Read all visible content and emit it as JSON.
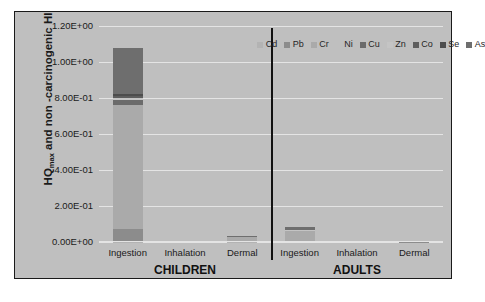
{
  "chart_data": {
    "type": "bar",
    "subtype": "stacked-bar",
    "title": "",
    "xlabel": "",
    "ylabel": "HQmax and non -carcinogenic HI",
    "ylabel_parts": {
      "prefix": "HQ",
      "sub": "max",
      "suffix": " and non -carcinogenic HI"
    },
    "ylim": [
      0,
      1.2
    ],
    "yticks": [
      0,
      0.2,
      0.4,
      0.6,
      0.8,
      1.0,
      1.2
    ],
    "ytick_labels": [
      "0.00E+00",
      "2.00E-01",
      "4.00E-01",
      "6.00E-01",
      "8.00E-01",
      "1.00E+00",
      "1.20E+00"
    ],
    "grid": true,
    "legend_position": "top-right",
    "categories": [
      "Ingestion",
      "Inhalation",
      "Dermal",
      "Ingestion",
      "Inhalation",
      "Dermal"
    ],
    "groups": [
      {
        "label": "CHILDREN",
        "categories": [
          "Ingestion",
          "Inhalation",
          "Dermal"
        ]
      },
      {
        "label": "ADULTS",
        "categories": [
          "Ingestion",
          "Inhalation",
          "Dermal"
        ]
      }
    ],
    "series": [
      {
        "name": "Cd",
        "color": "#b3b3b3",
        "values": [
          0.002,
          0.0,
          0.0005,
          0.0002,
          0.0,
          0.0
        ]
      },
      {
        "name": "Pb",
        "color": "#8c8c8c",
        "values": [
          0.068,
          0.0,
          0.004,
          0.006,
          0.0,
          0.0005
        ]
      },
      {
        "name": "Cr",
        "color": "#aaaaaa",
        "values": [
          0.69,
          0.0,
          0.022,
          0.055,
          0.0,
          0.0008
        ]
      },
      {
        "name": "Ni",
        "color": "#bfbfbf",
        "values": [
          0.0,
          0.0,
          0.0,
          0.0,
          0.0,
          0.0
        ]
      },
      {
        "name": "Cu",
        "color": "#6b6b6b",
        "values": [
          0.03,
          0.0,
          0.0008,
          0.002,
          0.0,
          0.0
        ]
      },
      {
        "name": "Zn",
        "color": "#c4c4c4",
        "values": [
          0.01,
          0.0,
          0.0008,
          0.001,
          0.0,
          0.0
        ]
      },
      {
        "name": "Co",
        "color": "#5e5e5e",
        "values": [
          0.013,
          0.0,
          0.0006,
          0.003,
          0.0,
          0.0
        ]
      },
      {
        "name": "Se",
        "color": "#4d4d4d",
        "values": [
          0.008,
          0.0,
          0.0004,
          0.001,
          0.0,
          0.0
        ]
      },
      {
        "name": "As",
        "color": "#6e6e6e",
        "values": [
          0.258,
          0.0,
          0.004,
          0.017,
          0.0,
          0.0
        ]
      }
    ],
    "totals": [
      1.079,
      0.0,
      0.033,
      0.085,
      0.0,
      0.0013
    ],
    "colors": {
      "background": "#bfbfbf",
      "gridline": "#e4e4e4",
      "border": "#1a1a1a",
      "divider": "#111111",
      "text": "#1a1a1a"
    }
  }
}
